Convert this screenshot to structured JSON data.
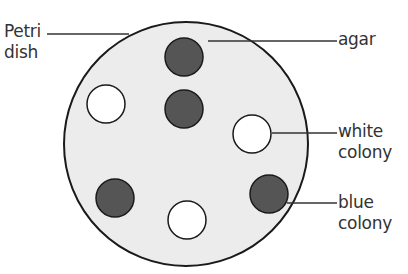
{
  "diagram": {
    "colors": {
      "agar": "#ececec",
      "outline": "#1a1a1a",
      "blue_colony": "#555555",
      "white_colony": "#ffffff",
      "leader_line": "#333333",
      "text": "#333333"
    },
    "labels": {
      "petri_dish_line1": "Petri",
      "petri_dish_line2": "dish",
      "agar": "agar",
      "white_colony_line1": "white",
      "white_colony_line2": "colony",
      "blue_colony_line1": "blue",
      "blue_colony_line2": "colony"
    },
    "dish": {
      "cx": 186,
      "cy": 144,
      "r": 122
    },
    "colonies": [
      {
        "type": "blue",
        "cx": 184,
        "cy": 57,
        "r": 19
      },
      {
        "type": "blue",
        "cx": 184,
        "cy": 109,
        "r": 19
      },
      {
        "type": "white",
        "cx": 106,
        "cy": 104,
        "r": 19
      },
      {
        "type": "white",
        "cx": 252,
        "cy": 134,
        "r": 19
      },
      {
        "type": "blue",
        "cx": 115,
        "cy": 198,
        "r": 19
      },
      {
        "type": "white",
        "cx": 187,
        "cy": 220,
        "r": 19
      },
      {
        "type": "blue",
        "cx": 269,
        "cy": 194,
        "r": 19
      }
    ]
  }
}
